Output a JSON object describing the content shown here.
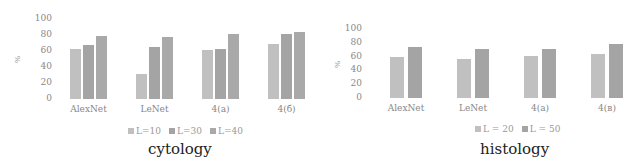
{
  "chart_data": [
    {
      "type": "bar",
      "title": "cytology",
      "xlabel": "",
      "ylabel": "%",
      "ylim": [
        0,
        100
      ],
      "yticks": [
        "0",
        "20",
        "40",
        "60",
        "80",
        "100"
      ],
      "categories": [
        "AlexNet",
        "LeNet",
        "4(a)",
        "4(б)"
      ],
      "series": [
        {
          "name": "L=10",
          "color": "#c0c0c0",
          "values": [
            62,
            31,
            61,
            69
          ]
        },
        {
          "name": "L=30",
          "color": "#a4a4a4",
          "values": [
            68,
            65,
            62,
            81
          ]
        },
        {
          "name": "L=40",
          "color": "#a9a9a9",
          "values": [
            79,
            78,
            81,
            84
          ]
        }
      ],
      "legend_position": "bottom",
      "grid": false
    },
    {
      "type": "bar",
      "title": "histology",
      "xlabel": "",
      "ylabel": "%",
      "ylim": [
        0,
        100
      ],
      "yticks": [
        "0",
        "20",
        "40",
        "60",
        "80",
        "100"
      ],
      "categories": [
        "AlexNet",
        "LeNet",
        "4(a)",
        "4(в)"
      ],
      "series": [
        {
          "name": "L = 20",
          "color": "#c0c0c0",
          "values": [
            59,
            56,
            61,
            64
          ]
        },
        {
          "name": "L = 50",
          "color": "#a4a4a4",
          "values": [
            74,
            71,
            71,
            78
          ]
        }
      ],
      "legend_position": "bottom",
      "grid": false
    }
  ]
}
